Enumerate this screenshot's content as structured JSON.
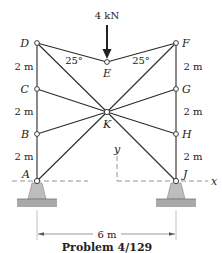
{
  "diagram": {
    "caption": "Problem 4/129",
    "load": {
      "label": "4 kN",
      "at_joint": "E",
      "direction": "down"
    },
    "joints": {
      "D": "D",
      "E": "E",
      "F": "F",
      "C": "C",
      "G": "G",
      "K": "K",
      "B": "B",
      "H": "H",
      "A": "A",
      "J": "J"
    },
    "angles": {
      "left": "25°",
      "right": "25°"
    },
    "vertical_dims": {
      "left": [
        "2 m",
        "2 m",
        "2 m",
        "2 m"
      ],
      "right": [
        "2 m",
        "2 m",
        "2 m",
        "2 m"
      ]
    },
    "horizontal_dim": "6 m",
    "axes": {
      "x": "x",
      "y": "y"
    },
    "supports": [
      "A",
      "J"
    ],
    "members": [
      [
        "D",
        "C"
      ],
      [
        "C",
        "B"
      ],
      [
        "B",
        "A"
      ],
      [
        "F",
        "G"
      ],
      [
        "G",
        "H"
      ],
      [
        "H",
        "J"
      ],
      [
        "D",
        "E"
      ],
      [
        "E",
        "F"
      ],
      [
        "D",
        "K"
      ],
      [
        "F",
        "K"
      ],
      [
        "C",
        "K"
      ],
      [
        "G",
        "K"
      ],
      [
        "B",
        "K"
      ],
      [
        "H",
        "K"
      ],
      [
        "A",
        "K"
      ],
      [
        "J",
        "K"
      ],
      [
        "E",
        "K"
      ]
    ]
  }
}
